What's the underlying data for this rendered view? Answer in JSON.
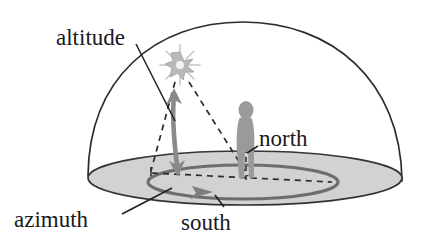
{
  "figure": {
    "background_color": "#ffffff",
    "width": 432,
    "height": 248
  },
  "labels": {
    "altitude": "altitude",
    "azimuth": "azimuth",
    "south": "south",
    "north": "north"
  },
  "colors": {
    "outline": "#2b2b2b",
    "ground_fill": "#d2d2d2",
    "ground_edge": "#3a3a3a",
    "arrow_gray": "#8a8a8a",
    "person_gray": "#9a9a9a",
    "sun_gray": "#b8b8b8",
    "dashed": "#2b2b2b",
    "text": "#191919"
  },
  "elements": {
    "dome": {
      "name": "celestial hemisphere",
      "apex": [
        243,
        22
      ],
      "left_base": [
        88,
        176
      ],
      "right_base": [
        402,
        181
      ]
    },
    "ground_plane": {
      "name": "horizon plane ellipse",
      "center": [
        245,
        178
      ],
      "rx": 157,
      "ry": 27
    },
    "azimuth_circle": {
      "name": "azimuth arc on horizon",
      "center": [
        243,
        182
      ],
      "rx": 95,
      "ry": 17,
      "arrowhead_at": [
        205,
        193
      ]
    },
    "sun": {
      "name": "sun starburst",
      "center": [
        180,
        65
      ],
      "radius": 16
    },
    "observer": {
      "name": "person silhouette",
      "head": [
        246,
        106
      ],
      "feet": [
        246,
        178
      ]
    },
    "altitude_arrow": {
      "name": "double headed altitude arrow",
      "from": [
        177,
        174
      ],
      "to": [
        174,
        90
      ],
      "double_headed": true
    },
    "azimuth_arrow": {
      "name": "azimuth arrow along horizon",
      "from": [
        152,
        190
      ],
      "to": [
        206,
        192
      ]
    },
    "dashed_lines": [
      {
        "name": "sun to horizon point",
        "from": [
          176,
          80
        ],
        "to": [
          151,
          172
        ]
      },
      {
        "name": "sun to observer feet",
        "from": [
          187,
          80
        ],
        "to": [
          249,
          176
        ]
      },
      {
        "name": "horizon baseline dashes",
        "from": [
          152,
          173
        ],
        "to": [
          330,
          182
        ]
      },
      {
        "name": "observer vertical",
        "from": [
          246,
          150
        ],
        "to": [
          246,
          180
        ]
      }
    ],
    "leader_lines": [
      {
        "name": "altitude leader",
        "from": [
          136,
          44
        ],
        "to": [
          174,
          120
        ]
      },
      {
        "name": "azimuth leader",
        "from": [
          123,
          213
        ],
        "to": [
          170,
          189
        ]
      },
      {
        "name": "south leader",
        "from": [
          222,
          206
        ],
        "to": [
          214,
          196
        ]
      },
      {
        "name": "north leader",
        "from": [
          256,
          145
        ],
        "to": [
          247,
          152
        ]
      }
    ]
  }
}
